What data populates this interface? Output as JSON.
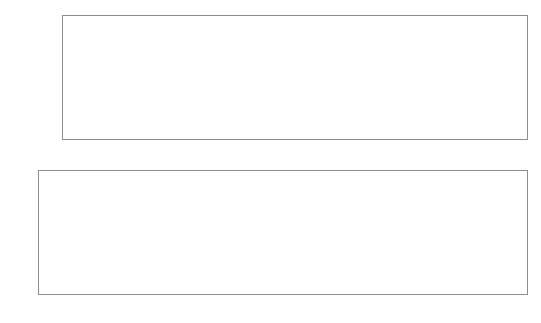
{
  "panels": {
    "top": {
      "name": "priors-count-histogram",
      "ylabel": "Frequency",
      "xlabel": "",
      "yticks": [
        "0",
        "500",
        "1000",
        "1500",
        "2000"
      ],
      "xticks": [
        "0",
        "5",
        "10",
        "15",
        "20",
        "25",
        "30",
        "35"
      ]
    },
    "bottom": {
      "name": "priors-log-histogram",
      "ylabel": "",
      "xlabel": "",
      "yticks": [
        "0",
        "100",
        "200",
        "300",
        "400",
        "500",
        "600"
      ],
      "xticks": [
        "-1.5",
        "-1.0",
        "-0.5",
        "0.0",
        "0.5",
        "1.0",
        "1.5",
        "2.0"
      ]
    }
  },
  "colors": {
    "series_dark": "#6e6e6e",
    "series_light": "#b4b4b4",
    "frame": "#8d8d8d",
    "grid": "#d2d2d2",
    "text": "#1a1a1a"
  },
  "chart_data": [
    {
      "type": "bar",
      "id": "top-histogram",
      "title": "Histogram of priors",
      "xlabel": "",
      "ylabel": "Frequency",
      "xlim": [
        -1.2,
        39.0
      ],
      "ylim": [
        0,
        2300
      ],
      "yticks": [
        0,
        500,
        1000,
        1500,
        2000
      ],
      "xticks": [
        0,
        5,
        10,
        15,
        20,
        25,
        30,
        35
      ],
      "grid": false,
      "legend": "none",
      "bin_edges": [
        0,
        3.75,
        7.5,
        11.25,
        15,
        18.75,
        22.5,
        26.25,
        30,
        33.75,
        37.5
      ],
      "series": [
        {
          "name": "dark",
          "color": "#6e6e6e",
          "values": [
            2200,
            700,
            345,
            190,
            75,
            75,
            20,
            5,
            2,
            0
          ]
        },
        {
          "name": "light",
          "color": "#b4b4b4",
          "values": [
            1870,
            390,
            120,
            40,
            15,
            10,
            3,
            0,
            0,
            0
          ]
        }
      ],
      "overlay_floor": {
        "name": "dark-foreground-base",
        "color": "#6e6e6e",
        "values": [
          330,
          50,
          0,
          0,
          0,
          0,
          0,
          0,
          0,
          0
        ]
      }
    },
    {
      "type": "bar",
      "id": "bottom-histogram",
      "title": "",
      "xlabel": "",
      "ylabel": "",
      "xlim": [
        -1.62,
        2.45
      ],
      "ylim": [
        0,
        620
      ],
      "yticks": [
        0,
        100,
        200,
        300,
        400,
        500,
        600
      ],
      "xticks": [
        -1.5,
        -1.0,
        -0.5,
        0.0,
        0.5,
        1.0,
        1.5,
        2.0
      ],
      "grid": true,
      "legend": "none",
      "bin_edges": [
        -1.35,
        -1.175,
        -0.99,
        -0.805,
        -0.62,
        -0.435,
        -0.25,
        -0.065,
        0.175,
        0.36,
        0.53,
        0.78,
        0.98,
        1.22,
        1.52,
        1.77,
        1.93,
        2.11,
        2.3
      ],
      "series": [
        {
          "name": "dark",
          "color": "#6e6e6e",
          "values": [
            590,
            175,
            143,
            480,
            295,
            120,
            120,
            50,
            50,
            415,
            260,
            200,
            200,
            145,
            70,
            30,
            30,
            30
          ]
        },
        {
          "name": "light",
          "color": "#b4b4b4",
          "values": [
            0,
            590,
            580,
            100,
            95,
            352,
            352,
            222,
            222,
            145,
            165,
            165,
            165,
            35,
            35,
            30,
            30,
            30
          ]
        }
      ]
    }
  ]
}
